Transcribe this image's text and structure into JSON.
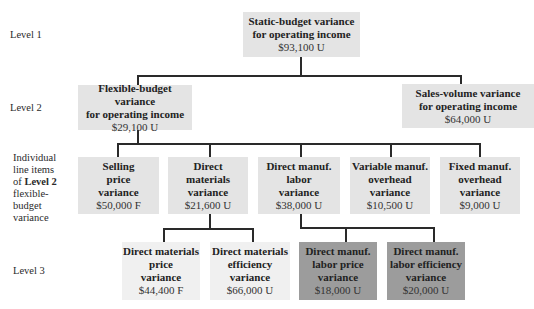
{
  "levels": {
    "level1": "Level 1",
    "level2": "Level 2",
    "line_items": [
      "Individual",
      "line items",
      "of ",
      "Level 2",
      "flexible-",
      "budget",
      "variance"
    ],
    "level3": "Level 3"
  },
  "nodes": {
    "static": {
      "lines": [
        "Static-budget variance",
        "for operating income"
      ],
      "value": "$93,100 U"
    },
    "flexible": {
      "lines": [
        "Flexible-budget variance",
        "for operating income"
      ],
      "value": "$29,100 U"
    },
    "sales_volume": {
      "lines": [
        "Sales-volume variance",
        "for operating income"
      ],
      "value": "$64,000 U"
    },
    "selling_price": {
      "lines": [
        "Selling",
        "price",
        "variance"
      ],
      "value": "$50,000 F"
    },
    "direct_materials": {
      "lines": [
        "Direct",
        "materials",
        "variance"
      ],
      "value": "$21,600 U"
    },
    "direct_labor": {
      "lines": [
        "Direct manuf.",
        "labor",
        "variance"
      ],
      "value": "$38,000 U"
    },
    "variable_overhead": {
      "lines": [
        "Variable manuf.",
        "overhead",
        "variance"
      ],
      "value": "$10,500 U"
    },
    "fixed_overhead": {
      "lines": [
        "Fixed manuf.",
        "overhead",
        "variance"
      ],
      "value": "$9,000 U"
    },
    "dm_price": {
      "lines": [
        "Direct materials",
        "price",
        "variance"
      ],
      "value": "$44,400 F"
    },
    "dm_efficiency": {
      "lines": [
        "Direct materials",
        "efficiency",
        "variance"
      ],
      "value": "$66,000 U"
    },
    "dl_price": {
      "lines": [
        "Direct manuf.",
        "labor price",
        "variance"
      ],
      "value": "$18,000 U"
    },
    "dl_efficiency": {
      "lines": [
        "Direct manuf.",
        "labor efficiency",
        "variance"
      ],
      "value": "$20,000 U"
    }
  },
  "colors": {
    "box": "#e4e4e4",
    "box_light": "#f0f0f0",
    "box_dark": "#9c9c9c",
    "line": "#2a2a2a"
  }
}
